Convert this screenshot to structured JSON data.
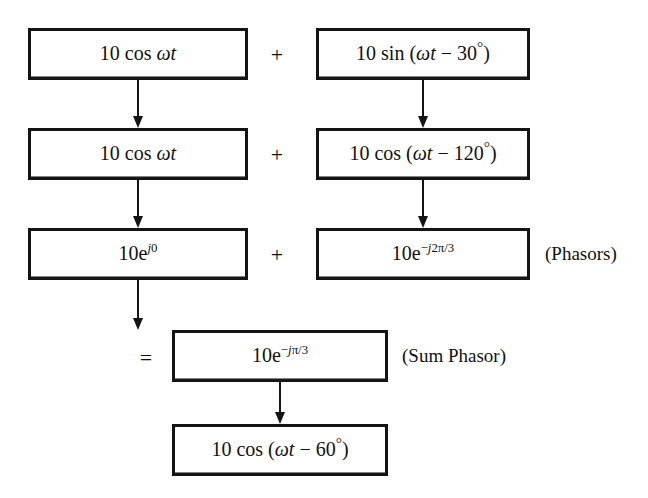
{
  "diagram": {
    "rows": [
      {
        "id": "row-time-domain-original",
        "left_box": "10 cos ωt",
        "operator": "+",
        "right_box": "10 sin (ωt − 30°)"
      },
      {
        "id": "row-time-domain-cosine",
        "left_box": "10 cos ωt",
        "operator": "+",
        "right_box": "10 cos (ωt − 120°)"
      },
      {
        "id": "row-phasors",
        "left_box": "10e^{j0}",
        "operator": "+",
        "right_box": "10e^{−j2π/3}",
        "caption": "(Phasors)"
      },
      {
        "id": "row-sum-phasor",
        "operator": "=",
        "center_box": "10e^{−jπ/3}",
        "caption": "(Sum Phasor)"
      },
      {
        "id": "row-result",
        "center_box": "10 cos (ωt − 60°)"
      }
    ],
    "expressions": {
      "amplitude": "10",
      "cos_label": "cos",
      "sin_label": "sin",
      "omega_t": "ωt",
      "phase_sin_1": "30°",
      "phase_cos_2": "120°",
      "phase_result": "60°",
      "phasor_1_exponent": "j0",
      "phasor_2_exponent": "−j2π/3",
      "sum_phasor_exponent": "−jπ/3"
    },
    "operators": {
      "plus": "+",
      "equals": "="
    },
    "captions": {
      "phasors": "(Phasors)",
      "sum_phasor": "(Sum Phasor)"
    },
    "colors": {
      "ink": "#141414",
      "paper": "#ffffff"
    }
  }
}
